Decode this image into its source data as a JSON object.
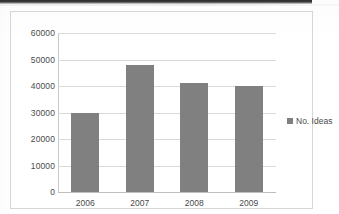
{
  "chart_data": {
    "type": "bar",
    "title": "",
    "xlabel": "",
    "ylabel": "",
    "categories": [
      "2006",
      "2007",
      "2008",
      "2009"
    ],
    "series": [
      {
        "name": "No. Ideas",
        "values": [
          30000,
          48000,
          41000,
          40000
        ]
      }
    ],
    "ylim": [
      0,
      60000
    ],
    "ytick_labels": [
      "0",
      "10000",
      "20000",
      "30000",
      "40000",
      "50000",
      "60000"
    ],
    "ytick_values": [
      0,
      10000,
      20000,
      30000,
      40000,
      50000,
      60000
    ],
    "grid": true,
    "legend_position": "right",
    "legend_entries": [
      "No. Ideas"
    ],
    "colors": {
      "bar": "#808080",
      "gridline": "#d9d9d9",
      "axis": "#c9c9c9",
      "text": "#4a4a4a",
      "frame": "#d8d8d8",
      "background": "#ffffff"
    }
  }
}
